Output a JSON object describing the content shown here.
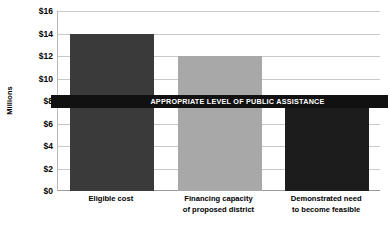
{
  "chart_data": {
    "type": "bar",
    "title": "",
    "xlabel": "",
    "ylabel": "Millions",
    "categories": [
      "Eligible cost",
      "Financing capacity of proposed district",
      "Demonstrated need to become feasible"
    ],
    "values": [
      14,
      12,
      8
    ],
    "ylim": [
      0,
      16
    ],
    "ytick_values": [
      0,
      2,
      4,
      6,
      8,
      10,
      12,
      14,
      16
    ],
    "ytick_labels": [
      "$0",
      "$2",
      "$4",
      "$6",
      "$8",
      "$10",
      "$12",
      "$14",
      "$16"
    ],
    "grid": true,
    "legend": "none",
    "value_prefix": "$",
    "units": "Millions",
    "annotations": [
      {
        "name": "threshold-banner",
        "text": "APPROPRIATE LEVEL OF PUBLIC ASSISTANCE",
        "value": 8,
        "color": "#111111",
        "text_color": "#ffffff"
      }
    ],
    "bar_colors": [
      "#3a3a3a",
      "#a8a8a8",
      "#1c1c1c"
    ],
    "background": "#ffffff",
    "gridline_color": "#c9c9c9"
  },
  "axis": {
    "y_title": "Millions",
    "ticks": [
      {
        "label": "$16",
        "value": 16
      },
      {
        "label": "$14",
        "value": 14
      },
      {
        "label": "$12",
        "value": 12
      },
      {
        "label": "$10",
        "value": 10
      },
      {
        "label": "$8",
        "value": 8
      },
      {
        "label": "$6",
        "value": 6
      },
      {
        "label": "$4",
        "value": 4
      },
      {
        "label": "$2",
        "value": 2
      },
      {
        "label": "$0",
        "value": 0
      }
    ]
  },
  "bars": [
    {
      "label_line1": "Eligible cost",
      "label_line2": "",
      "value": 14,
      "color": "#3a3a3a"
    },
    {
      "label_line1": "Financing capacity",
      "label_line2": "of proposed district",
      "value": 12,
      "color": "#a8a8a8"
    },
    {
      "label_line1": "Demonstrated need",
      "label_line2": "to become feasible",
      "value": 8,
      "color": "#1c1c1c"
    }
  ],
  "banner": {
    "text": "APPROPRIATE LEVEL OF PUBLIC ASSISTANCE"
  }
}
